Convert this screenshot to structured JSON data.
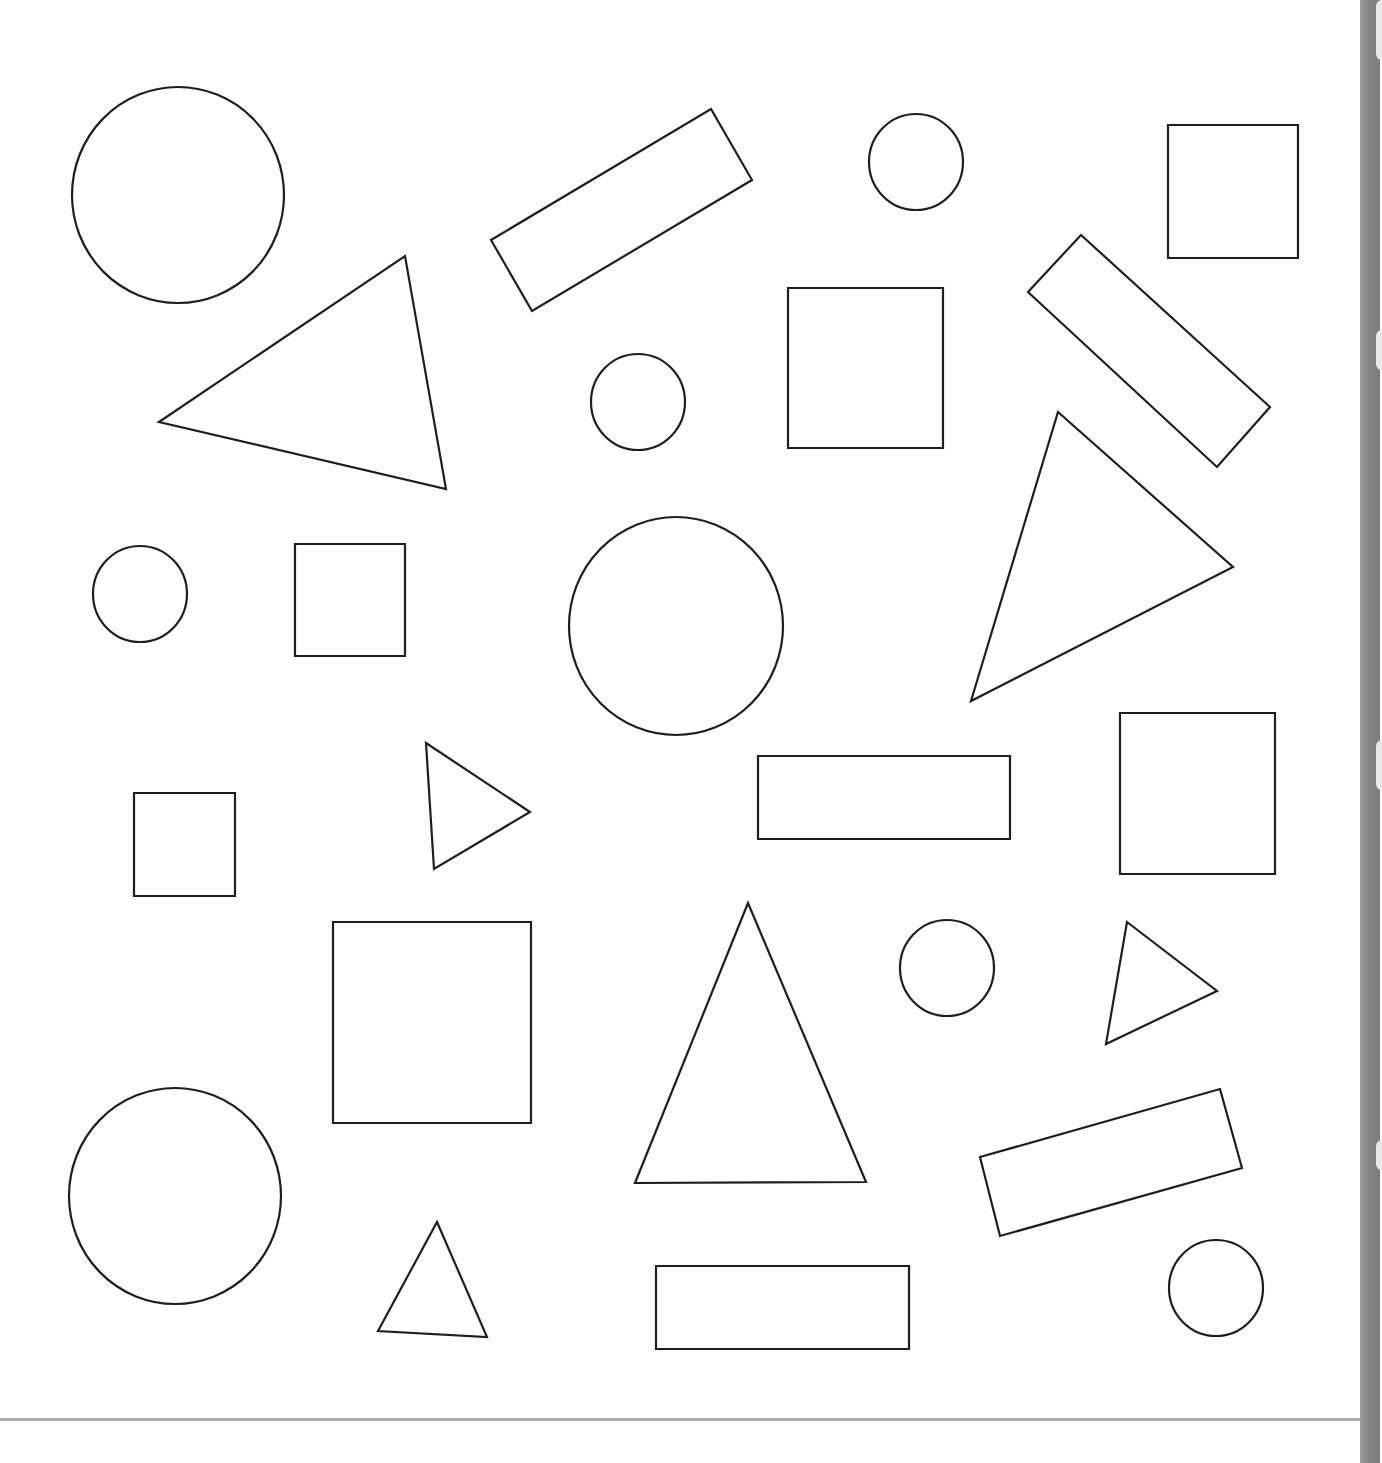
{
  "worksheet": {
    "background": "#fefefe",
    "stroke_color": "#1e1e1e",
    "shapes": [
      {
        "type": "circle",
        "cx": 178,
        "cy": 195,
        "rx": 106,
        "ry": 108
      },
      {
        "type": "polygon",
        "kind": "rectangle",
        "points": "491,240 711,109 752,180 532,311"
      },
      {
        "type": "circle",
        "cx": 916,
        "cy": 162,
        "rx": 47,
        "ry": 48
      },
      {
        "type": "polygon",
        "kind": "square",
        "points": "1168,125 1298,125 1298,258 1168,258"
      },
      {
        "type": "polygon",
        "kind": "triangle",
        "points": "159,422 405,256 446,489"
      },
      {
        "type": "circle",
        "cx": 638,
        "cy": 402,
        "rx": 47,
        "ry": 48
      },
      {
        "type": "polygon",
        "kind": "square",
        "points": "788,288 943,288 943,448 788,448"
      },
      {
        "type": "polygon",
        "kind": "rectangle",
        "points": "1028,292 1081,235 1270,407 1217,467"
      },
      {
        "type": "polygon",
        "kind": "triangle",
        "points": "1058,412 1233,567 971,701"
      },
      {
        "type": "circle",
        "cx": 140,
        "cy": 594,
        "rx": 47,
        "ry": 48
      },
      {
        "type": "polygon",
        "kind": "square",
        "points": "295,544 405,544 405,656 295,656"
      },
      {
        "type": "circle",
        "cx": 676,
        "cy": 626,
        "rx": 107,
        "ry": 109
      },
      {
        "type": "polygon",
        "kind": "square",
        "points": "134,793 235,793 235,896 134,896"
      },
      {
        "type": "polygon",
        "kind": "triangle",
        "points": "426,743 530,812 434,869"
      },
      {
        "type": "polygon",
        "kind": "rectangle",
        "points": "758,756 1010,756 1010,839 758,839"
      },
      {
        "type": "polygon",
        "kind": "square",
        "points": "1120,713 1275,713 1275,874 1120,874"
      },
      {
        "type": "polygon",
        "kind": "square",
        "points": "333,922 531,922 531,1123 333,1123"
      },
      {
        "type": "polygon",
        "kind": "triangle",
        "points": "748,903 866,1182 635,1183"
      },
      {
        "type": "circle",
        "cx": 947,
        "cy": 968,
        "rx": 47,
        "ry": 48
      },
      {
        "type": "polygon",
        "kind": "triangle",
        "points": "1127,922 1217,991 1106,1044"
      },
      {
        "type": "circle",
        "cx": 175,
        "cy": 1196,
        "rx": 106,
        "ry": 108
      },
      {
        "type": "polygon",
        "kind": "rectangle",
        "points": "980,1157 1220,1089 1242,1168 1000,1236"
      },
      {
        "type": "polygon",
        "kind": "triangle",
        "points": "437,1222 487,1337 378,1331"
      },
      {
        "type": "polygon",
        "kind": "rectangle",
        "points": "656,1266 909,1266 909,1349 656,1349"
      },
      {
        "type": "circle",
        "cx": 1216,
        "cy": 1288,
        "rx": 47,
        "ry": 48
      }
    ]
  },
  "page_edge": {
    "strip_color": "#8c8c8c",
    "divider_color": "#a9a9a9"
  }
}
